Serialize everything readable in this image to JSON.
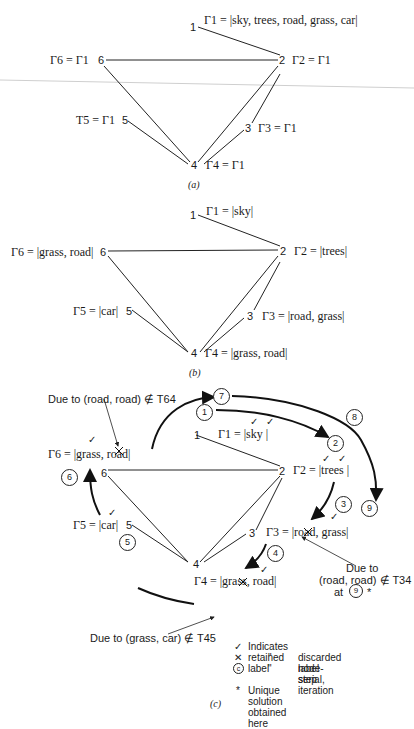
{
  "panel_a": {
    "caption": "(a)",
    "nodes": [
      {
        "id": "1",
        "label": "Γ1 = |sky, trees, road, grass, car|"
      },
      {
        "id": "2",
        "label": "Γ2 = Γ1"
      },
      {
        "id": "3",
        "label": "Γ3 = Γ1"
      },
      {
        "id": "4",
        "label": "Γ4 = Γ1"
      },
      {
        "id": "5",
        "label": "T5 = Γ1"
      },
      {
        "id": "6",
        "label": "Γ6 = Γ1"
      }
    ]
  },
  "panel_b": {
    "caption": "(b)",
    "nodes": [
      {
        "id": "1",
        "label": "Γ1 = |sky|"
      },
      {
        "id": "2",
        "label": "Γ2 = |trees|"
      },
      {
        "id": "3",
        "label": "Γ3 = |road, grass|"
      },
      {
        "id": "4",
        "label": "Γ4 = |grass, road|"
      },
      {
        "id": "5",
        "label": "Γ5 = |car|"
      },
      {
        "id": "6",
        "label": "Γ6 = |grass, road|"
      }
    ]
  },
  "panel_c": {
    "caption": "(c)",
    "nodes": [
      {
        "id": "1",
        "label": "Γ1 = |sky  |"
      },
      {
        "id": "2",
        "label": "Γ2 = |trees |"
      },
      {
        "id": "3",
        "label": "Γ3 = |road, grass|"
      },
      {
        "id": "4",
        "label": "Γ4 = |grass, road|"
      },
      {
        "id": "5",
        "label": "Γ5 = |car|"
      },
      {
        "id": "6",
        "label": "Γ6 = |grass, road|"
      }
    ],
    "steps": [
      "1",
      "2",
      "3",
      "4",
      "5",
      "6",
      "7",
      "8",
      "9"
    ],
    "annotations": {
      "t64": "Due to (road, road) ∉ T64",
      "t34_line1": "Due to",
      "t34_line2": "(road, road) ∉ T34",
      "t34_line3": "at",
      "t34_step": "9",
      "t34_star": "*",
      "t45": "Due to (grass, car) ∉ T45"
    }
  },
  "edges": [
    [
      "1",
      "2"
    ],
    [
      "2",
      "6"
    ],
    [
      "6",
      "4"
    ],
    [
      "2",
      "4"
    ],
    [
      "2",
      "3"
    ],
    [
      "3",
      "4"
    ],
    [
      "5",
      "4"
    ]
  ],
  "legend": {
    "check_symbol": "✓",
    "check_text": "Indicates retained label",
    "cross_symbol": "✕",
    "ditto": "\"",
    "cross_text": "discarded label",
    "circle_symbol": "c",
    "circle_text": "node-serial, iteration",
    "circle_text2": "step",
    "star_symbol": "*",
    "star_text": "Unique solution obtained here"
  }
}
